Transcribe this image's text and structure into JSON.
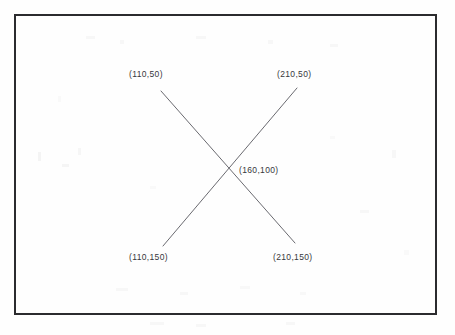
{
  "figure": {
    "background_color": "#fefefe",
    "frame": {
      "name": "figure-border",
      "color": "#2b2b2e",
      "thickness_px": 2,
      "x": 14,
      "y": 14,
      "width": 423,
      "height": 301
    },
    "line_color": "#6a6a70",
    "line_width_px": 1,
    "text_color": "#37373b"
  },
  "labels": {
    "top_left": "(110,50)",
    "top_right": "(210,50)",
    "center": "(160,100)",
    "bottom_left": "(110,150)",
    "bottom_right": "(210,150)"
  },
  "chart_data": {
    "type": "line",
    "title": "",
    "xlabel": "",
    "ylabel": "",
    "grid": false,
    "legend": null,
    "xlim": [
      100,
      220
    ],
    "ylim": [
      40,
      160
    ],
    "y_axis_inverted": true,
    "annotations": [
      {
        "text": "(110,50)",
        "x": 110,
        "y": 50,
        "position": "above-left"
      },
      {
        "text": "(210,50)",
        "x": 210,
        "y": 50,
        "position": "above-right"
      },
      {
        "text": "(160,100)",
        "x": 160,
        "y": 100,
        "position": "right"
      },
      {
        "text": "(110,150)",
        "x": 110,
        "y": 150,
        "position": "below-left"
      },
      {
        "text": "(210,150)",
        "x": 210,
        "y": 150,
        "position": "below-right"
      }
    ],
    "series": [
      {
        "name": "line-a",
        "comment": "from (110,50) to (210,150)",
        "x": [
          110,
          210
        ],
        "y": [
          50,
          150
        ],
        "pixel_points": [
          [
            161,
            91
          ],
          [
            295,
            243
          ]
        ]
      },
      {
        "name": "line-b",
        "comment": "from (110,150) to (210,50)",
        "x": [
          110,
          210
        ],
        "y": [
          150,
          50
        ],
        "pixel_points": [
          [
            163,
            246
          ],
          [
            297,
            88
          ]
        ]
      }
    ],
    "intersection": {
      "x": 160,
      "y": 100,
      "pixel_point": [
        228,
        168
      ]
    }
  }
}
